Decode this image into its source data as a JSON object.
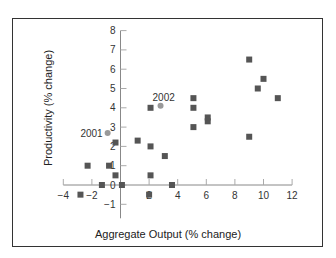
{
  "chart_data": {
    "type": "scatter",
    "title": "",
    "xlabel": "Aggregate Output (% change)",
    "ylabel": "Productivity (% change)",
    "xlim": [
      -4,
      12
    ],
    "ylim": [
      -1,
      8
    ],
    "xticks": [
      -4,
      -2,
      2,
      4,
      6,
      8,
      10,
      12
    ],
    "yticks": [
      -1,
      0,
      1,
      2,
      3,
      4,
      5,
      6,
      7,
      8
    ],
    "grid": false,
    "legend": null,
    "series": [
      {
        "name": "Other years",
        "marker": "square",
        "color": "#555555",
        "points": [
          [
            -2.8,
            -0.5
          ],
          [
            -2.3,
            1.0
          ],
          [
            -1.3,
            0.0
          ],
          [
            -0.8,
            1.0
          ],
          [
            -0.35,
            0.5
          ],
          [
            -0.35,
            2.2
          ],
          [
            0.1,
            0.0
          ],
          [
            1.2,
            2.3
          ],
          [
            2.0,
            -0.5
          ],
          [
            2.1,
            0.5
          ],
          [
            2.1,
            2.0
          ],
          [
            2.1,
            4.0
          ],
          [
            3.1,
            1.5
          ],
          [
            3.6,
            0.0
          ],
          [
            5.1,
            3.0
          ],
          [
            5.1,
            4.0
          ],
          [
            5.1,
            4.5
          ],
          [
            6.1,
            3.3
          ],
          [
            6.1,
            3.5
          ],
          [
            9.0,
            2.5
          ],
          [
            9.0,
            6.5
          ],
          [
            9.6,
            5.0
          ],
          [
            10.0,
            5.5
          ],
          [
            11.0,
            4.5
          ]
        ]
      },
      {
        "name": "Highlighted years",
        "marker": "circle",
        "color": "#999999",
        "points": [
          {
            "x": -0.9,
            "y": 2.7,
            "label": "2001"
          },
          {
            "x": 2.8,
            "y": 4.1,
            "label": "2002"
          }
        ]
      }
    ]
  }
}
